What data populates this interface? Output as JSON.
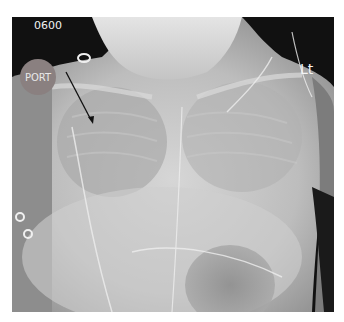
{
  "image": {
    "type": "chest-radiograph",
    "view": "AP portable",
    "annotations": {
      "time_label": "0600",
      "port_label": "PORT",
      "side_marker": "Lt",
      "arrow": {
        "from": [
          54,
          55
        ],
        "to": [
          81,
          107
        ],
        "color": "#111111"
      }
    },
    "colors": {
      "background_dark": "#0d0d0d",
      "soft_tissue": "#9a9a9a",
      "bright_opacity": "#d8d8d8",
      "gastric_bubble": "#8c8c8c"
    }
  }
}
